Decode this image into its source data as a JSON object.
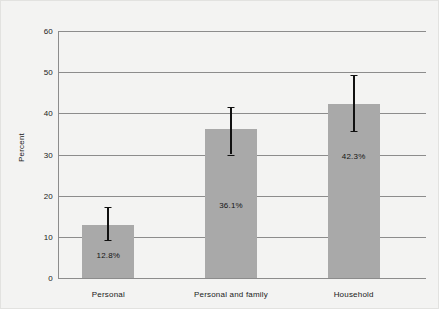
{
  "chart_data": {
    "type": "bar",
    "title": "",
    "subtitle": "",
    "xlabel": "",
    "ylabel": "Percent",
    "categories": [
      "Personal",
      "Personal and family",
      "Household"
    ],
    "values": [
      12.8,
      36.1,
      42.3
    ],
    "value_labels": [
      "12.8%",
      "36.1%",
      "42.3%"
    ],
    "errors": [
      {
        "low": 9.2,
        "high": 17.2
      },
      {
        "low": 30.0,
        "high": 41.5
      },
      {
        "low": 35.6,
        "high": 49.2
      }
    ],
    "ylim": [
      0,
      60
    ],
    "yticks": [
      0,
      10,
      20,
      30,
      40,
      50,
      60
    ],
    "ytick_labels": [
      "0",
      "10",
      "20",
      "30",
      "40",
      "50",
      "60"
    ],
    "grid": true,
    "legend": "none",
    "colors": {
      "bar_fill": "#a9a9a9",
      "gridline": "#8c8c8c",
      "axis": "#8c8c8c",
      "errorbar": "#111111",
      "text": "#1a1a1a",
      "background": "#f3f3f2",
      "border": "#e2e2e0"
    }
  }
}
